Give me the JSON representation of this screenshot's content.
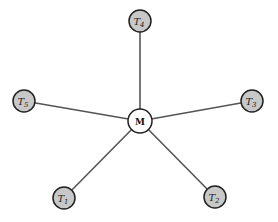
{
  "diagram": {
    "type": "star-graph",
    "center": {
      "id": "M",
      "label": "M",
      "x": 140,
      "y": 121,
      "r": 12,
      "fill": "#ffffff"
    },
    "nodes": [
      {
        "id": "T1",
        "base": "T",
        "sub": "1",
        "x": 64,
        "y": 198
      },
      {
        "id": "T2",
        "base": "T",
        "sub": "2",
        "x": 215,
        "y": 197
      },
      {
        "id": "T3",
        "base": "T",
        "sub": "3",
        "x": 252,
        "y": 101
      },
      {
        "id": "T4",
        "base": "T",
        "sub": "4",
        "x": 140,
        "y": 21
      },
      {
        "id": "T5",
        "base": "T",
        "sub": "5",
        "x": 24,
        "y": 101
      }
    ],
    "node_radius": 11,
    "node_fill": "#c8c8c8",
    "stroke": "#222222",
    "edge_color": "#555555"
  }
}
